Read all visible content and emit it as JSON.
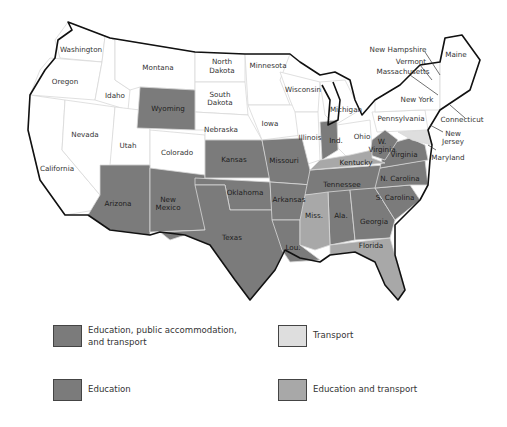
{
  "colors": {
    "education_public_accommodation_transport": "#7b7b7b",
    "education": "#7b7b7b",
    "transport": "#dedede",
    "education_and_transport": "#a8a8a8",
    "none": "#ffffff"
  },
  "states": {
    "washington": "Washington",
    "oregon": "Oregon",
    "california": "California",
    "nevada": "Nevada",
    "idaho": "Idaho",
    "montana": "Montana",
    "wyoming": "Wyoming",
    "utah": "Utah",
    "colorado": "Colorado",
    "arizona": "Arizona",
    "new_mexico_1": "New",
    "new_mexico_2": "Mexico",
    "north_dakota_1": "North",
    "north_dakota_2": "Dakota",
    "south_dakota_1": "South",
    "south_dakota_2": "Dakota",
    "nebraska": "Nebraska",
    "kansas": "Kansas",
    "oklahoma": "Oklahoma",
    "texas": "Texas",
    "minnesota": "Minnesota",
    "iowa": "Iowa",
    "missouri": "Missouri",
    "arkansas": "Arkansas",
    "louisiana": "Lou.",
    "wisconsin": "Wisconsin",
    "illinois": "Illinois",
    "michigan": "Michigan",
    "indiana": "Ind.",
    "ohio": "Ohio",
    "kentucky": "Kentucky",
    "tennessee": "Tennessee",
    "mississippi": "Miss.",
    "alabama": "Ala.",
    "georgia": "Georgia",
    "florida": "Florida",
    "south_carolina": "S. Carolina",
    "north_carolina": "N. Carolina",
    "virginia": "Virginia",
    "west_virginia_1": "W.",
    "west_virginia_2": "Virginia",
    "maryland": "Maryland",
    "pennsylvania": "Pennsylvania",
    "new_york": "New York",
    "new_jersey_1": "New",
    "new_jersey_2": "Jersey",
    "connecticut": "Connecticut",
    "massachusetts": "Massachusetts",
    "vermont": "Vermont",
    "new_hampshire": "New Hampshire",
    "maine": "Maine"
  },
  "legend": [
    {
      "label": "Education, public accommodation, and transport",
      "color": "#7b7b7b"
    },
    {
      "label": "Transport",
      "color": "#dedede"
    },
    {
      "label": "Education",
      "color": "#7b7b7b"
    },
    {
      "label": "Education and transport",
      "color": "#a8a8a8"
    }
  ]
}
